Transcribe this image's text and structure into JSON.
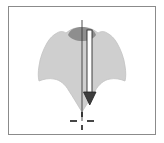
{
  "figure": {
    "panel_label": "",
    "frame": {
      "border_color": "#8b8b8b",
      "background_color": "#ffffff",
      "x": 8,
      "y": 6,
      "width": 148,
      "height": 129
    },
    "specimen": {
      "name": "specimen-silhouette",
      "fill_color": "#cfcfcf",
      "stroke_color": "#bdbdbd",
      "outline": "M 82 28 C 74 27 70 30 66 33 C 63 31 60 31 57 33 C 53 35 50 38 47 43 C 43 50 40 58 39 66 C 38 72 38 77 39 81 C 44 79 49 78 54 79 C 60 80 65 84 69 91 C 73 97 77 104 82 112 C 87 104 91 97 95 91 C 99 84 104 80 110 79 C 115 78 120 79 125 81 C 126 77 126 72 125 66 C 124 58 121 50 117 43 C 114 38 111 35 107 33 C 104 31 101 31 98 33 C 94 30 90 27 82 28 Z",
      "apex_cap": {
        "name": "apical-cap",
        "fill_color": "#8e8e8e",
        "path": "M 68 35 C 70 29 76 27 82 27 C 88 27 94 29 96 35 C 93 39 88 41 82 41 C 76 41 71 39 68 35 Z"
      }
    },
    "axis_line": {
      "name": "vertical-axis-line",
      "color": "#3a3a3a",
      "x": 82,
      "y_top": 20,
      "y_bottom": 121,
      "width": 1
    },
    "measure_arrow": {
      "name": "downward-measure-arrow",
      "fill_color": "#ffffff",
      "stroke_color": "#2b2b2b",
      "shaft_x": 90,
      "shaft_top": 30,
      "shaft_bottom": 92,
      "head_tip_y": 104,
      "head_half_width": 6,
      "direction": "down"
    },
    "crosshair_marker": {
      "name": "dashed-crosshair-marker",
      "color": "#1a1a1a",
      "center_x": 82,
      "center_y": 121,
      "arm_length": 10,
      "dash_gap": 3,
      "style": "dashed-cross"
    }
  }
}
